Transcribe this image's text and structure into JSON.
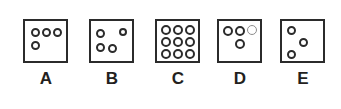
{
  "figure": {
    "type": "multiple-choice-dot-pattern",
    "background_color": "#ffffff",
    "stroke_color": "#2b2b2b",
    "faint_stroke_color": "#8d8d8d",
    "box_size_px": 45,
    "options": [
      {
        "label": "A",
        "left": 15,
        "dot_count": 4,
        "dots": [
          {
            "x": 6,
            "y": 7,
            "d": 9,
            "faint": false
          },
          {
            "x": 17,
            "y": 7,
            "d": 9,
            "faint": false
          },
          {
            "x": 28,
            "y": 7,
            "d": 9,
            "faint": false
          },
          {
            "x": 6,
            "y": 20,
            "d": 9,
            "faint": false
          }
        ]
      },
      {
        "label": "B",
        "left": 81,
        "dot_count": 4,
        "dots": [
          {
            "x": 5,
            "y": 8,
            "d": 9,
            "faint": false
          },
          {
            "x": 28,
            "y": 7,
            "d": 8,
            "faint": false
          },
          {
            "x": 5,
            "y": 22,
            "d": 9,
            "faint": false
          },
          {
            "x": 17,
            "y": 23,
            "d": 9,
            "faint": false
          }
        ]
      },
      {
        "label": "C",
        "left": 147,
        "dot_count": 9,
        "dots": [
          {
            "x": 4,
            "y": 4,
            "d": 10,
            "faint": false
          },
          {
            "x": 16,
            "y": 4,
            "d": 10,
            "faint": false
          },
          {
            "x": 28,
            "y": 4,
            "d": 10,
            "faint": false
          },
          {
            "x": 4,
            "y": 16,
            "d": 10,
            "faint": false
          },
          {
            "x": 16,
            "y": 16,
            "d": 10,
            "faint": false
          },
          {
            "x": 28,
            "y": 16,
            "d": 10,
            "faint": false
          },
          {
            "x": 4,
            "y": 28,
            "d": 10,
            "faint": false
          },
          {
            "x": 16,
            "y": 28,
            "d": 10,
            "faint": false
          },
          {
            "x": 28,
            "y": 28,
            "d": 10,
            "faint": false
          }
        ]
      },
      {
        "label": "D",
        "left": 209,
        "dot_count": 4,
        "dots": [
          {
            "x": 4,
            "y": 5,
            "d": 10,
            "faint": false
          },
          {
            "x": 16,
            "y": 5,
            "d": 10,
            "faint": false
          },
          {
            "x": 28,
            "y": 4,
            "d": 10,
            "faint": true
          },
          {
            "x": 16,
            "y": 18,
            "d": 10,
            "faint": false
          }
        ]
      },
      {
        "label": "E",
        "left": 272,
        "dot_count": 3,
        "dots": [
          {
            "x": 5,
            "y": 5,
            "d": 9,
            "faint": false
          },
          {
            "x": 17,
            "y": 17,
            "d": 9,
            "faint": false
          },
          {
            "x": 5,
            "y": 29,
            "d": 9,
            "faint": false
          }
        ]
      }
    ]
  }
}
